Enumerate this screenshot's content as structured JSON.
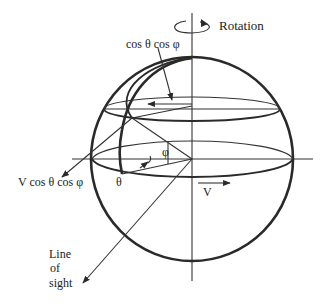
{
  "figure": {
    "labels": {
      "rotation": "Rotation",
      "top_component": "cos θ cos φ",
      "left_component": "V cos θ cos φ",
      "theta": "θ",
      "phi": "φ",
      "velocity": "V",
      "line_of_sight_1": "Line",
      "line_of_sight_2": "of",
      "line_of_sight_3": "sight"
    },
    "colors": {
      "ink": "#2a2a2a",
      "background": "#ffffff"
    }
  }
}
